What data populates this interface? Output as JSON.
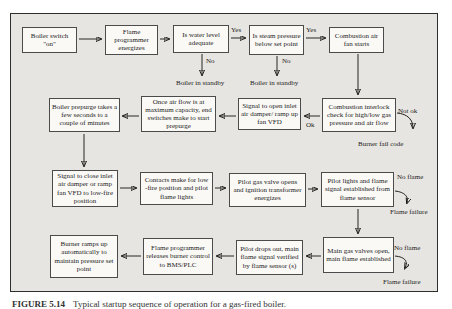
{
  "figure_caption": {
    "label": "FIGURE 5.14",
    "text": "Typical startup sequence of operation for a gas-fired boiler."
  },
  "colors": {
    "figure_bg": "#e7e5e1",
    "node_bg": "#faf9f6",
    "node_border": "#4b4b4b",
    "arrow": "#111111",
    "text": "#1c1c1c"
  },
  "nodes": {
    "boiler_switch": "Boiler switch \"on\"",
    "flame_programmer_energizes": "Flame programmer energizes",
    "water_level_check": "Is water level adequate",
    "steam_pressure_check": "Is steam pressure below set point",
    "combustion_fan_starts": "Combustion air fan starts",
    "boiler_prepurge": "Boiler prepurge takes a few seconds to a couple of minutes",
    "airflow_max": "Once air flow is at maximum capacity, end switches make to start prepurge",
    "signal_open_damper": "Signal to open inlet air damper/ ramp up fan VFD",
    "interlock_check": "Combustion interlock check for high/low gas pressure and air flow",
    "signal_close_damper": "Signal to close inlet air damper or ramp fan VFD to low-fire position",
    "contacts_low_fire": "Contacts make for low -fire position and pilot flame lights",
    "pilot_gas_valve": "Pilot gas valve opens and ignition transformer energizes",
    "pilot_lights": "Pilot lights and flame signal established from flame sensor",
    "burner_ramps_up": "Burner ramps up automatically to maintain pressure set point",
    "programmer_releases": "Flame programmer releases burner control to BMS/PLC",
    "pilot_drops_out": "Pilot drops out, main flame signal verified by flame sensor (s)",
    "main_gas_valves": "Main gas valves open, main flame established"
  },
  "labels": {
    "yes_water": "Yes",
    "yes_steam": "Yes",
    "no_water": "No",
    "no_steam": "No",
    "standby_water": "Boiler in standby",
    "standby_steam": "Boiler in standby",
    "ok": "Ok",
    "not_ok": "Not ok",
    "burner_fail_code": "Burner fail code",
    "no_flame_pilot": "No flame",
    "flame_failure_pilot": "Flame failure",
    "no_flame_main": "No flame",
    "flame_failure_main": "Flame failure"
  },
  "edges": [
    {
      "from": "boiler_switch",
      "to": "flame_programmer_energizes",
      "label": ""
    },
    {
      "from": "flame_programmer_energizes",
      "to": "water_level_check",
      "label": ""
    },
    {
      "from": "water_level_check",
      "to": "steam_pressure_check",
      "label": "Yes"
    },
    {
      "from": "water_level_check",
      "to": "boiler_in_standby",
      "label": "No"
    },
    {
      "from": "steam_pressure_check",
      "to": "combustion_fan_starts",
      "label": "Yes"
    },
    {
      "from": "steam_pressure_check",
      "to": "boiler_in_standby",
      "label": "No"
    },
    {
      "from": "combustion_fan_starts",
      "to": "interlock_check",
      "label": ""
    },
    {
      "from": "interlock_check",
      "to": "signal_open_damper",
      "label": "Ok"
    },
    {
      "from": "interlock_check",
      "to": "burner_fail_code",
      "label": "Not ok"
    },
    {
      "from": "signal_open_damper",
      "to": "airflow_max",
      "label": ""
    },
    {
      "from": "airflow_max",
      "to": "boiler_prepurge",
      "label": ""
    },
    {
      "from": "boiler_prepurge",
      "to": "signal_close_damper",
      "label": ""
    },
    {
      "from": "signal_close_damper",
      "to": "contacts_low_fire",
      "label": ""
    },
    {
      "from": "contacts_low_fire",
      "to": "pilot_gas_valve",
      "label": ""
    },
    {
      "from": "pilot_gas_valve",
      "to": "pilot_lights",
      "label": ""
    },
    {
      "from": "pilot_lights",
      "to": "flame_failure",
      "label": "No flame"
    },
    {
      "from": "pilot_lights",
      "to": "main_gas_valves",
      "label": ""
    },
    {
      "from": "main_gas_valves",
      "to": "flame_failure",
      "label": "No flame"
    },
    {
      "from": "main_gas_valves",
      "to": "pilot_drops_out",
      "label": ""
    },
    {
      "from": "pilot_drops_out",
      "to": "programmer_releases",
      "label": ""
    },
    {
      "from": "programmer_releases",
      "to": "burner_ramps_up",
      "label": ""
    }
  ]
}
